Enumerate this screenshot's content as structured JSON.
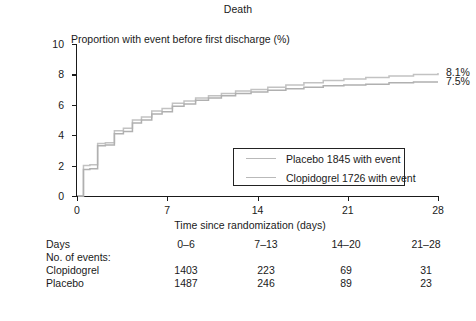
{
  "chart": {
    "title": "Death",
    "ylabel": "Proportion with event before first discharge (%)",
    "xlabel": "Time since randomization (days)"
  },
  "axes": {
    "yticks": [
      "10",
      "8",
      "6",
      "4",
      "2",
      "0"
    ],
    "xticks": [
      "0",
      "7",
      "14",
      "21",
      "28"
    ]
  },
  "legend": {
    "items": [
      {
        "label": "Placebo 1845 with event",
        "color": "#c2c2c2"
      },
      {
        "label": "Clopidogrel 1726 with event",
        "color": "#b0b0b0"
      }
    ]
  },
  "endpoint_labels": {
    "placebo": "8.1%",
    "clopidogrel": "7.5%"
  },
  "table": {
    "header_label": "Days",
    "section_label": "No. of events:",
    "columns": [
      "0–6",
      "7–13",
      "14–20",
      "21–28"
    ],
    "rows": [
      {
        "label": "Clopidogrel",
        "values": [
          "1403",
          "223",
          "69",
          "31"
        ]
      },
      {
        "label": "Placebo",
        "values": [
          "1487",
          "246",
          "89",
          "23"
        ]
      }
    ]
  },
  "chart_data": {
    "type": "line",
    "title": "Death",
    "xlabel": "Time since randomization (days)",
    "ylabel": "Proportion with event before first discharge (%)",
    "xlim": [
      0,
      28
    ],
    "ylim": [
      0,
      10
    ],
    "xticks": [
      0,
      7,
      14,
      21,
      28
    ],
    "yticks": [
      0,
      2,
      4,
      6,
      8,
      10
    ],
    "grid": false,
    "legend_position": "inside-lower-right",
    "step_style": "post",
    "annotations": [
      {
        "text": "8.1%",
        "x": 28,
        "y": 8.1,
        "series": "Placebo"
      },
      {
        "text": "7.5%",
        "x": 28,
        "y": 7.5,
        "series": "Clopidogrel"
      }
    ],
    "series": [
      {
        "name": "Placebo",
        "color": "#c2c2c2",
        "final_value": 8.1,
        "x": [
          0,
          0.5,
          1,
          1.6,
          2.2,
          2.9,
          3.6,
          4.3,
          5.0,
          5.8,
          6.6,
          7.4,
          8.3,
          9.2,
          10.2,
          11.2,
          12.3,
          13.5,
          14.8,
          16.2,
          17.6,
          19.1,
          20.7,
          22.4,
          24.2,
          26.1,
          28
        ],
        "y": [
          0,
          2.0,
          2.05,
          3.45,
          3.5,
          4.3,
          4.45,
          5.0,
          5.2,
          5.6,
          5.75,
          6.1,
          6.25,
          6.45,
          6.6,
          6.75,
          6.9,
          7.0,
          7.15,
          7.3,
          7.45,
          7.6,
          7.7,
          7.8,
          7.9,
          8.0,
          8.1
        ]
      },
      {
        "name": "Clopidogrel",
        "color": "#b0b0b0",
        "final_value": 7.5,
        "x": [
          0,
          0.5,
          1,
          1.6,
          2.2,
          2.9,
          3.6,
          4.3,
          5.0,
          5.8,
          6.6,
          7.4,
          8.3,
          9.2,
          10.2,
          11.2,
          12.3,
          13.5,
          14.8,
          16.2,
          17.6,
          19.1,
          20.7,
          22.4,
          24.2,
          26.1,
          28
        ],
        "y": [
          0,
          1.75,
          1.8,
          3.3,
          3.35,
          4.1,
          4.25,
          4.8,
          5.0,
          5.4,
          5.55,
          5.9,
          6.05,
          6.3,
          6.45,
          6.6,
          6.75,
          6.85,
          6.95,
          7.05,
          7.15,
          7.25,
          7.3,
          7.35,
          7.45,
          7.5,
          7.5
        ]
      }
    ]
  }
}
